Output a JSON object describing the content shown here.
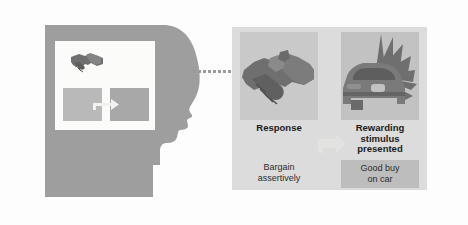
{
  "figure": {
    "name": "operant-conditioning-diagram",
    "background_color": "#fdfdfd"
  },
  "head": {
    "silhouette_color": "#9e9e9e",
    "thought_box_color": "#fbfbfa",
    "handshake_icon_name": "handshake-icon",
    "concept_rect_left_color": "#b9b9b9",
    "concept_rect_right_color": "#a8a8a8",
    "connector_arrow_name": "concept-arrow-icon"
  },
  "connector": {
    "name": "dotted-thought-connector",
    "dot_color": "#9a9a9a",
    "dot_count": 9
  },
  "panel": {
    "background_color": "#dcdcdc",
    "arrow_color": "#dedede",
    "cells": [
      {
        "id": "response",
        "art_icon_name": "handshake-illustration",
        "title": "Response",
        "caption": "Bargain\nassertively",
        "caption_line1": "Bargain",
        "caption_line2": "assertively",
        "art_background": "#c9c9c9"
      },
      {
        "id": "stimulus",
        "art_icon_name": "car-with-starburst-illustration",
        "title": "Rewarding\nstimulus\npresented",
        "title_line1": "Rewarding",
        "title_line2": "stimulus",
        "title_line3": "presented",
        "caption": "Good buy\non car",
        "caption_line1": "Good buy",
        "caption_line2": "on car",
        "art_background": "#c2c2c2",
        "caption_background": "#bdbdbd"
      }
    ]
  }
}
